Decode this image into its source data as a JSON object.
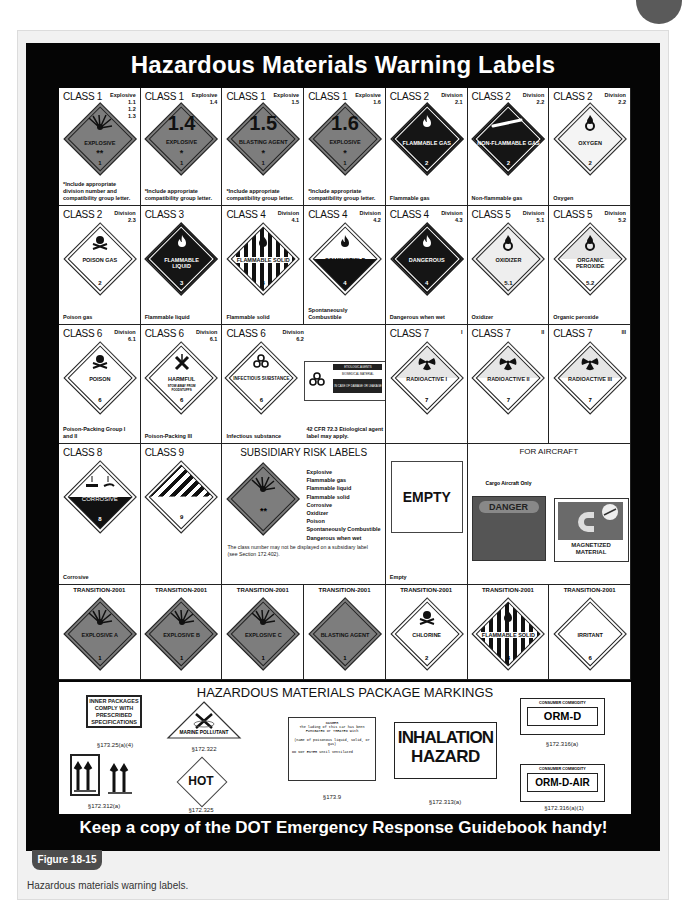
{
  "poster": {
    "title": "Hazardous Materials Warning Labels",
    "footer": "Keep a copy of the DOT Emergency Response Guidebook handy!"
  },
  "row1": [
    {
      "cls": "CLASS 1",
      "div": "Explosive\n1.1\n1.2\n1.3",
      "label": "EXPLOSIVE",
      "mark": "**",
      "num": "1",
      "cap": "*Include appropriate division number and compatibility group letter."
    },
    {
      "cls": "CLASS 1",
      "div": "Explosive\n1.4",
      "big": "1.4",
      "label": "EXPLOSIVE",
      "mark": "*",
      "num": "1",
      "cap": "*Include appropriate compatibility group letter."
    },
    {
      "cls": "CLASS 1",
      "div": "Explosive\n1.5",
      "big": "1.5",
      "label": "BLASTING AGENT",
      "mark": "*",
      "num": "1",
      "cap": "*Include appropriate compatibility group letter."
    },
    {
      "cls": "CLASS 1",
      "div": "Explosive\n1.6",
      "big": "1.6",
      "label": "EXPLOSIVE",
      "mark": "*",
      "num": "1",
      "cap": "*Include appropriate compatibility group letter."
    },
    {
      "cls": "CLASS 2",
      "div": "Division\n2.1",
      "label": "FLAMMABLE GAS",
      "num": "2",
      "cap": "Flammable gas"
    },
    {
      "cls": "CLASS 2",
      "div": "Division\n2.2",
      "label": "NON-FLAMMABLE GAS",
      "num": "2",
      "cap": "Non-flammable gas"
    },
    {
      "cls": "CLASS 2",
      "div": "Division\n2.2",
      "label": "OXYGEN",
      "num": "2",
      "cap": "Oxygen"
    }
  ],
  "row2": [
    {
      "cls": "CLASS 2",
      "div": "Division\n2.3",
      "label": "POISON GAS",
      "num": "2",
      "cap": "Poison gas"
    },
    {
      "cls": "CLASS 3",
      "div": "",
      "label": "FLAMMABLE LIQUID",
      "num": "3",
      "cap": "Flammable liquid"
    },
    {
      "cls": "CLASS 4",
      "div": "Division\n4.1",
      "label": "FLAMMABLE SOLID",
      "num": "4",
      "cap": "Flammable solid"
    },
    {
      "cls": "CLASS 4",
      "div": "Division\n4.2",
      "label": "COMBUSTIBLE",
      "num": "4",
      "cap": "Spontaneously Combustible"
    },
    {
      "cls": "CLASS 4",
      "div": "Division\n4.3",
      "label": "DANGEROUS",
      "num": "4",
      "cap": "Dangerous when wet"
    },
    {
      "cls": "CLASS 5",
      "div": "Division\n5.1",
      "label": "OXIDIZER",
      "num": "5.1",
      "cap": "Oxidizer"
    },
    {
      "cls": "CLASS 5",
      "div": "Division\n5.2",
      "label": "ORGANIC PEROXIDE",
      "num": "5.2",
      "cap": "Organic peroxide"
    }
  ],
  "row3": [
    {
      "cls": "CLASS 6",
      "div": "Division\n6.1",
      "label": "POISON",
      "num": "6",
      "cap": "Poison-Packing Group I and II"
    },
    {
      "cls": "CLASS 6",
      "div": "Division\n6.1",
      "label": "HARMFUL",
      "sub": "STOW AWAY FROM FOODSTUFFS",
      "num": "6",
      "cap": "Poison-Packing III"
    },
    {
      "cls": "CLASS 6",
      "div": "Division\n6.2",
      "label": "INFECTIOUS SUBSTANCE",
      "num": "6",
      "cap": "Infectious substance",
      "cap2": "42 CFR 72.3 Etiological agent label may apply.",
      "bio_head": "ETIOLOGIC AGENTS",
      "bio_mid": "BIOMEDICAL MATERIAL",
      "bio_low": "IN CASE OF DAMAGE OR LEAKAGE"
    },
    {
      "cls": "CLASS 7",
      "div": "I",
      "label": "RADIOACTIVE I",
      "num": "7",
      "cap": ""
    },
    {
      "cls": "CLASS 7",
      "div": "II",
      "label": "RADIOACTIVE II",
      "num": "7",
      "cap": ""
    },
    {
      "cls": "CLASS 7",
      "div": "III",
      "label": "RADIOACTIVE III",
      "num": "7",
      "cap": ""
    }
  ],
  "row4": {
    "class8": {
      "cls": "CLASS 8",
      "label": "CORROSIVE",
      "num": "8",
      "cap": "Corrosive"
    },
    "class9": {
      "cls": "CLASS 9",
      "num": "9"
    },
    "subsidiary": {
      "title": "SUBSIDIARY RISK LABELS",
      "mark": "**",
      "items": [
        "Explosive",
        "Flammable gas",
        "Flammable liquid",
        "Flammable solid",
        "Corrosive",
        "Oxidizer",
        "Poison",
        "Spontaneously Combustible",
        "Dangerous when wet"
      ],
      "note": "The class number may not be displayed on a subsidiary label (see Section 172.402)."
    },
    "empty": {
      "label": "EMPTY",
      "cap": "Empty"
    },
    "aircraft": {
      "title": "FOR AIRCRAFT",
      "sub": "Cargo Aircraft Only",
      "danger": "DANGER",
      "magnet": "MAGNETIZED MATERIAL"
    }
  },
  "row5": [
    {
      "head": "TRANSITION-2001",
      "label": "EXPLOSIVE A",
      "num": "1"
    },
    {
      "head": "TRANSITION-2001",
      "label": "EXPLOSIVE B",
      "num": "1"
    },
    {
      "head": "TRANSITION-2001",
      "label": "EXPLOSIVE C",
      "num": "1"
    },
    {
      "head": "TRANSITION-2001",
      "label": "BLASTING AGENT",
      "num": "1"
    },
    {
      "head": "TRANSITION-2001",
      "label": "CHLORINE",
      "num": "2"
    },
    {
      "head": "TRANSITION-2001",
      "label": "FLAMMABLE SOLID",
      "num": "4"
    },
    {
      "head": "TRANSITION-2001",
      "label": "IRRITANT",
      "num": "6"
    }
  ],
  "markings": {
    "title": "HAZARDOUS MATERIALS PACKAGE MARKINGS",
    "inner": "INNER PACKAGES COMPLY WITH PRESCRIBED SPECIFICATIONS",
    "inner_ref": "§173.25(a)(4)",
    "arrows_ref": "§172.312(a)",
    "marine": "MARINE POLLUTANT",
    "marine_ref": "§172.322",
    "hot": "HOT",
    "hot_ref": "§172.325",
    "fumigant_l1": "DANGER",
    "fumigant_l2": "The lading of this car has been FUMIGATED or TREATED with",
    "fumigant_l3": "(name of poisonous liquid, solid, or gas)",
    "fumigant_l4": "DO NOT ENTER until ventilated",
    "fumigant_ref": "§173.9",
    "inhalation_1": "INHALATION",
    "inhalation_2": "HAZARD",
    "inhalation_ref": "§172.313(a)",
    "orm_head": "CONSUMER COMMODITY",
    "orm": "ORM-D",
    "orm_ref": "§172.316(a)",
    "ormair_head": "CONSUMER COMMODITY",
    "ormair": "ORM-D-AIR",
    "ormair_ref": "§172.316(a)(1)"
  },
  "figure": {
    "tab": "Figure 18-15",
    "caption": "Hazardous materials warning labels."
  },
  "colors": {
    "explosive_orange_gray": "#7d7d7d",
    "black": "#111111",
    "figure_tab": "#4d4d4d",
    "frame_bg": "#f1f1f1"
  }
}
